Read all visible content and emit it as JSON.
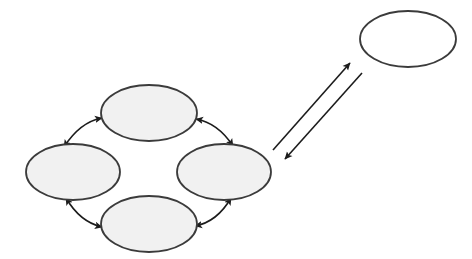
{
  "canvas": {
    "width": 472,
    "height": 259,
    "background_color": "#ffffff",
    "title": "Cycle diagram of four linked shaded ellipses with an external unshaded ellipse"
  },
  "style": {
    "shaded_fill": "#f1f1f1",
    "unshaded_fill": "#ffffff",
    "outline_color": "#3b3b3b",
    "outline_width": 1.8,
    "arrow_color": "#1c1c1c",
    "arrow_width": 1.6
  },
  "nodes": [
    {
      "id": "node-top",
      "name": "top-ellipse",
      "label": "",
      "shape": "ellipse",
      "fill": "#f1f1f1",
      "cx": 149,
      "cy": 113,
      "rx": 48,
      "ry": 28
    },
    {
      "id": "node-left",
      "name": "left-ellipse",
      "label": "",
      "shape": "ellipse",
      "fill": "#f1f1f1",
      "cx": 73,
      "cy": 172,
      "rx": 47,
      "ry": 28
    },
    {
      "id": "node-right",
      "name": "right-ellipse",
      "label": "",
      "shape": "ellipse",
      "fill": "#f1f1f1",
      "cx": 224,
      "cy": 172,
      "rx": 47,
      "ry": 28
    },
    {
      "id": "node-bottom",
      "name": "bottom-ellipse",
      "label": "",
      "shape": "ellipse",
      "fill": "#f1f1f1",
      "cx": 149,
      "cy": 224,
      "rx": 48,
      "ry": 28
    },
    {
      "id": "node-external",
      "name": "external-ellipse",
      "label": "",
      "shape": "ellipse",
      "fill": "#ffffff",
      "cx": 408,
      "cy": 39,
      "rx": 48,
      "ry": 28
    }
  ],
  "connectors": [
    {
      "id": "edge-left-top",
      "name": "connector-left-top",
      "from": "node-left",
      "to": "node-top",
      "style": "curved",
      "arrowheads": "both",
      "path": "M 64 147 Q 80 122 102 118"
    },
    {
      "id": "edge-top-right",
      "name": "connector-top-right",
      "from": "node-top",
      "to": "node-right",
      "style": "curved",
      "arrowheads": "both",
      "path": "M 196 119 Q 218 123 233 146"
    },
    {
      "id": "edge-left-bottom",
      "name": "connector-left-bottom",
      "from": "node-left",
      "to": "node-bottom",
      "style": "curved",
      "arrowheads": "both",
      "path": "M 66 198 Q 80 222 102 227"
    },
    {
      "id": "edge-bottom-right",
      "name": "connector-bottom-right",
      "from": "node-bottom",
      "to": "node-right",
      "style": "curved",
      "arrowheads": "both",
      "path": "M 195 226 Q 217 222 231 198"
    },
    {
      "id": "edge-outbound",
      "name": "connector-outbound-to-external",
      "from": "node-right",
      "to": "node-external",
      "style": "straight",
      "arrowheads": "end",
      "path": "M 273 150 L 350 63"
    },
    {
      "id": "edge-inbound",
      "name": "connector-inbound-from-external",
      "from": "node-external",
      "to": "node-right",
      "style": "straight",
      "arrowheads": "end",
      "path": "M 362 73 L 285 159"
    }
  ]
}
